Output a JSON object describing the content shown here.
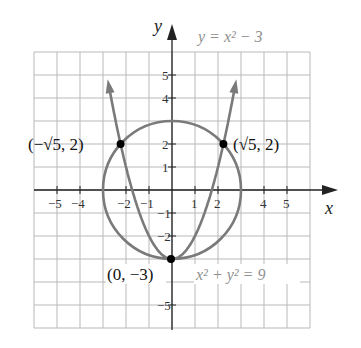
{
  "diagram": {
    "title": "",
    "axes": {
      "x_label": "x",
      "y_label": "y",
      "x_ticks": [
        "-5",
        "-4",
        "-2",
        "-1",
        "1",
        "2",
        "4",
        "5"
      ],
      "y_ticks": [
        "5",
        "4",
        "2",
        "1",
        "-1",
        "-2",
        "-5"
      ]
    },
    "equations": {
      "parabola": "y = x² − 3",
      "circle": "x² + y² = 9"
    },
    "points": [
      {
        "label": "(−√5, 2)",
        "x": -2.236,
        "y": 2
      },
      {
        "label": "(√5, 2)",
        "x": 2.236,
        "y": 2
      },
      {
        "label": "(0, −3)",
        "x": 0,
        "y": -3
      }
    ],
    "colors": {
      "curve": "#7a7a7a",
      "grid": "#b9b9b9",
      "axis": "#222222",
      "point": "#000000"
    }
  }
}
